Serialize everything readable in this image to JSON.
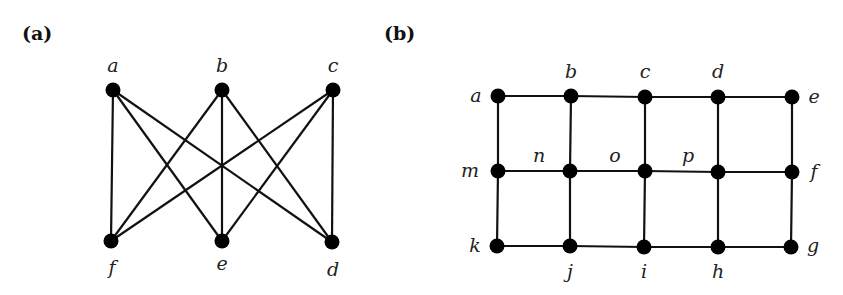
{
  "figure": {
    "panels": [
      {
        "id": "a",
        "label": "(a)",
        "label_pos": [
          22,
          40
        ],
        "nodes": [
          {
            "id": "a",
            "x": 113,
            "y": 90,
            "label": "a",
            "lx": 113,
            "ly": 72
          },
          {
            "id": "b",
            "x": 222,
            "y": 90,
            "label": "b",
            "lx": 222,
            "ly": 72
          },
          {
            "id": "c",
            "x": 333,
            "y": 90,
            "label": "c",
            "lx": 333,
            "ly": 72
          },
          {
            "id": "f",
            "x": 111,
            "y": 241,
            "label": "f",
            "lx": 112,
            "ly": 274
          },
          {
            "id": "e",
            "x": 222,
            "y": 241,
            "label": "e",
            "lx": 222,
            "ly": 270
          },
          {
            "id": "d",
            "x": 332,
            "y": 242,
            "label": "d",
            "lx": 333,
            "ly": 276
          }
        ],
        "edges": [
          [
            "a",
            "f"
          ],
          [
            "a",
            "e"
          ],
          [
            "a",
            "d"
          ],
          [
            "b",
            "f"
          ],
          [
            "b",
            "e"
          ],
          [
            "b",
            "d"
          ],
          [
            "c",
            "f"
          ],
          [
            "c",
            "e"
          ],
          [
            "c",
            "d"
          ]
        ]
      },
      {
        "id": "b",
        "label": "(b)",
        "label_pos": [
          384,
          40
        ],
        "nodes": [
          {
            "id": "a",
            "x": 498,
            "y": 96,
            "label": "a",
            "lx": 476,
            "ly": 102
          },
          {
            "id": "b",
            "x": 571,
            "y": 96,
            "label": "b",
            "lx": 571,
            "ly": 78
          },
          {
            "id": "c",
            "x": 645,
            "y": 97,
            "label": "c",
            "lx": 645,
            "ly": 78
          },
          {
            "id": "d",
            "x": 718,
            "y": 97,
            "label": "d",
            "lx": 718,
            "ly": 78
          },
          {
            "id": "e",
            "x": 792,
            "y": 97,
            "label": "e",
            "lx": 814,
            "ly": 103
          },
          {
            "id": "m",
            "x": 498,
            "y": 171,
            "label": "m",
            "lx": 470,
            "ly": 177
          },
          {
            "id": "nn",
            "x": 570,
            "y": 171,
            "label": "",
            "lx": 0,
            "ly": 0
          },
          {
            "id": "oo",
            "x": 645,
            "y": 171,
            "label": "",
            "lx": 0,
            "ly": 0
          },
          {
            "id": "pp",
            "x": 718,
            "y": 172,
            "label": "",
            "lx": 0,
            "ly": 0
          },
          {
            "id": "f",
            "x": 792,
            "y": 172,
            "label": "f",
            "lx": 814,
            "ly": 178
          },
          {
            "id": "k",
            "x": 497,
            "y": 246,
            "label": "k",
            "lx": 475,
            "ly": 252
          },
          {
            "id": "j",
            "x": 570,
            "y": 246,
            "label": "j",
            "lx": 570,
            "ly": 278
          },
          {
            "id": "i",
            "x": 644,
            "y": 247,
            "label": "i",
            "lx": 644,
            "ly": 278
          },
          {
            "id": "h",
            "x": 718,
            "y": 247,
            "label": "h",
            "lx": 718,
            "ly": 278
          },
          {
            "id": "g",
            "x": 791,
            "y": 247,
            "label": "g",
            "lx": 813,
            "ly": 252
          }
        ],
        "extra_labels": [
          {
            "text": "n",
            "x": 539,
            "y": 162
          },
          {
            "text": "o",
            "x": 615,
            "y": 162
          },
          {
            "text": "p",
            "x": 688,
            "y": 162
          }
        ],
        "edges": [
          [
            "a",
            "b"
          ],
          [
            "b",
            "c"
          ],
          [
            "c",
            "d"
          ],
          [
            "d",
            "e"
          ],
          [
            "m",
            "nn"
          ],
          [
            "nn",
            "oo"
          ],
          [
            "oo",
            "pp"
          ],
          [
            "pp",
            "f"
          ],
          [
            "k",
            "j"
          ],
          [
            "j",
            "i"
          ],
          [
            "i",
            "h"
          ],
          [
            "h",
            "g"
          ],
          [
            "a",
            "m"
          ],
          [
            "m",
            "k"
          ],
          [
            "b",
            "nn"
          ],
          [
            "nn",
            "j"
          ],
          [
            "c",
            "oo"
          ],
          [
            "oo",
            "i"
          ],
          [
            "d",
            "pp"
          ],
          [
            "pp",
            "h"
          ],
          [
            "e",
            "f"
          ],
          [
            "f",
            "g"
          ]
        ]
      }
    ]
  }
}
